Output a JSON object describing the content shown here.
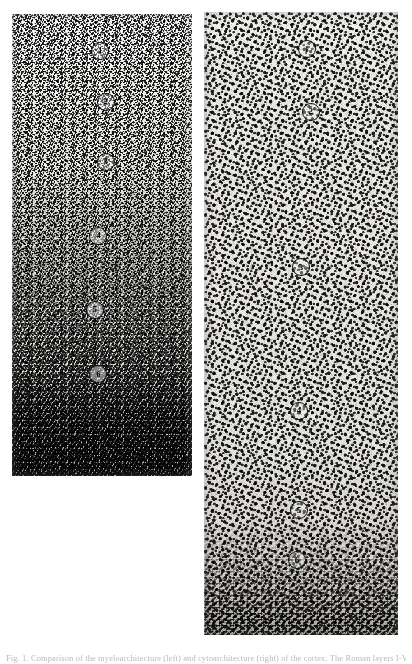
{
  "figure": {
    "caption": "Fig. 1.  Comparison of the myeloarchitecture (left) and cytoarchitecture (right) of the cortex. The Roman layers I-VI are indicated.",
    "panels": [
      {
        "id": "left",
        "name": "myelin-stained-section",
        "stain_label": "myelin stain",
        "markers": [
          {
            "label": "1",
            "x_pct": 49,
            "y_pct": 8
          },
          {
            "label": "2",
            "x_pct": 52,
            "y_pct": 19
          },
          {
            "label": "3",
            "x_pct": 52,
            "y_pct": 32
          },
          {
            "label": "4",
            "x_pct": 48,
            "y_pct": 48
          },
          {
            "label": "5",
            "x_pct": 46,
            "y_pct": 64
          },
          {
            "label": "6",
            "x_pct": 48,
            "y_pct": 78
          }
        ]
      },
      {
        "id": "right",
        "name": "nissl-stained-section",
        "stain_label": "Nissl stain",
        "markers": [
          {
            "label": "1",
            "x_pct": 53,
            "y_pct": 6
          },
          {
            "label": "2",
            "x_pct": 55,
            "y_pct": 16
          },
          {
            "label": "3",
            "x_pct": 50,
            "y_pct": 41
          },
          {
            "label": "4",
            "x_pct": 49,
            "y_pct": 64
          },
          {
            "label": "5",
            "x_pct": 49,
            "y_pct": 80
          },
          {
            "label": "6",
            "x_pct": 48,
            "y_pct": 88
          }
        ]
      }
    ]
  },
  "colors": {
    "page_background": "#ffffff",
    "plate_tone_left": "#f6f5f2",
    "plate_tone_right": "#f1efeb",
    "ink": "#0b0b0b",
    "caption_text": "#b9b9b9"
  }
}
